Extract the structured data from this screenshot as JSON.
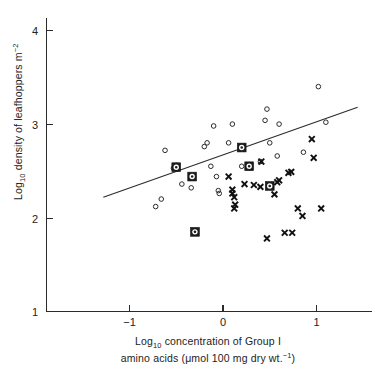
{
  "figure": {
    "title": "",
    "background_color": "#ffffff",
    "ink_color": "#2b2b2b"
  },
  "axes": {
    "y": {
      "label_main": "Log",
      "label_sub": "10",
      "label_rest": " density of leafhoppers m",
      "label_sup": "−2",
      "ticks": [
        "1",
        "2",
        "3",
        "4"
      ],
      "tick_values": [
        1,
        2,
        3,
        4
      ],
      "range": [
        1,
        4.15
      ]
    },
    "x": {
      "label_line1_main": "Log",
      "label_line1_sub": "10",
      "label_line1_rest": " concentration of Group I",
      "label_line2_pre": "amino acids (",
      "label_line2_mu": "μ",
      "label_line2_mid": "mol 100 mg dry wt.",
      "label_line2_sup": "−1",
      "label_line2_post": ")",
      "ticks": [
        "−1",
        "0",
        "1"
      ],
      "tick_values": [
        -1,
        0,
        1
      ],
      "range": [
        -1.85,
        1.45
      ]
    }
  },
  "chart_data": {
    "type": "scatter",
    "title": "",
    "xlabel": "Log10 concentration of Group I amino acids (μmol 100 mg dry wt.⁻¹)",
    "ylabel": "Log10 density of leafhoppers m⁻²",
    "xlim": [
      -1.85,
      1.45
    ],
    "ylim": [
      1.0,
      4.15
    ],
    "xticks": [
      -1,
      0,
      1
    ],
    "yticks": [
      1,
      2,
      3,
      4
    ],
    "grid": false,
    "legend": "none",
    "series": [
      {
        "name": "open-circle",
        "marker": "open circle",
        "points": [
          [
            -0.72,
            2.12
          ],
          [
            -0.66,
            2.2
          ],
          [
            -0.62,
            2.72
          ],
          [
            -0.53,
            2.53
          ],
          [
            -0.5,
            2.56
          ],
          [
            -0.44,
            2.36
          ],
          [
            -0.34,
            2.32
          ],
          [
            -0.2,
            2.76
          ],
          [
            -0.17,
            2.8
          ],
          [
            -0.13,
            2.55
          ],
          [
            -0.1,
            2.98
          ],
          [
            -0.07,
            2.44
          ],
          [
            -0.05,
            2.29
          ],
          [
            -0.04,
            2.26
          ],
          [
            0.06,
            2.8
          ],
          [
            0.1,
            3.0
          ],
          [
            0.2,
            2.55
          ],
          [
            0.4,
            2.6
          ],
          [
            0.45,
            3.04
          ],
          [
            0.47,
            3.16
          ],
          [
            0.5,
            2.8
          ],
          [
            0.58,
            2.66
          ],
          [
            0.6,
            3.0
          ],
          [
            0.86,
            2.7
          ],
          [
            1.02,
            3.4
          ],
          [
            1.1,
            3.02
          ]
        ]
      },
      {
        "name": "cross",
        "marker": "x",
        "points": [
          [
            0.06,
            2.44
          ],
          [
            0.1,
            2.26
          ],
          [
            0.1,
            2.3
          ],
          [
            0.12,
            2.22
          ],
          [
            0.12,
            2.1
          ],
          [
            0.13,
            2.14
          ],
          [
            0.23,
            2.36
          ],
          [
            0.33,
            2.35
          ],
          [
            0.4,
            2.33
          ],
          [
            0.41,
            2.6
          ],
          [
            0.47,
            1.78
          ],
          [
            0.55,
            2.25
          ],
          [
            0.58,
            2.38
          ],
          [
            0.6,
            2.4
          ],
          [
            0.66,
            1.84
          ],
          [
            0.7,
            2.48
          ],
          [
            0.73,
            2.49
          ],
          [
            0.74,
            1.84
          ],
          [
            0.8,
            2.1
          ],
          [
            0.85,
            2.02
          ],
          [
            0.95,
            2.84
          ],
          [
            0.97,
            2.64
          ],
          [
            1.05,
            2.1
          ]
        ]
      },
      {
        "name": "boxed-circle",
        "marker": "filled square with circle",
        "points": [
          [
            -0.5,
            2.54
          ],
          [
            -0.33,
            2.44
          ],
          [
            -0.3,
            1.85
          ],
          [
            0.2,
            2.75
          ],
          [
            0.28,
            2.55
          ],
          [
            0.5,
            2.34
          ]
        ]
      }
    ],
    "trend_line": {
      "type": "linear fit",
      "x_start": -1.28,
      "y_start": 2.22,
      "x_end": 1.44,
      "y_end": 3.18
    }
  }
}
